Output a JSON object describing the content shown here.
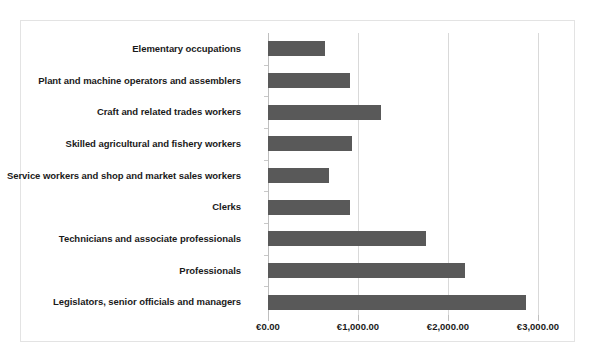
{
  "chart_data": {
    "type": "bar",
    "orientation": "horizontal",
    "title": "",
    "subtitle": "",
    "xlabel": "",
    "ylabel": "",
    "xlim": [
      0,
      3000
    ],
    "grid": true,
    "legend": false,
    "currency_symbol": "€",
    "categories": [
      "Elementary occupations",
      "Plant and machine operators and assemblers",
      "Craft and related trades workers",
      "Skilled agricultural and fishery workers",
      "Service workers and shop and market sales workers",
      "Clerks",
      "Technicians and associate professionals",
      "Professionals",
      "Legislators, senior officials and managers"
    ],
    "values": [
      630,
      910,
      1250,
      930,
      680,
      910,
      1750,
      2190,
      2870
    ],
    "tick_values": [
      0,
      1000,
      2000,
      3000
    ],
    "tick_labels": [
      "€0.00",
      "€1,000.00",
      "€2,000.00",
      "€3,000.00"
    ],
    "series": [
      {
        "name": "Average monthly earnings",
        "color": "#595959",
        "values": [
          630,
          910,
          1250,
          930,
          680,
          910,
          1750,
          2190,
          2870
        ]
      }
    ]
  },
  "style": {
    "bar_color": "#595959",
    "gridline_color": "#d9d9d9",
    "axis_color": "#bfbfbf",
    "border_color": "#e3e3e3",
    "background": "#ffffff",
    "text_color": "#1a1a1a"
  }
}
